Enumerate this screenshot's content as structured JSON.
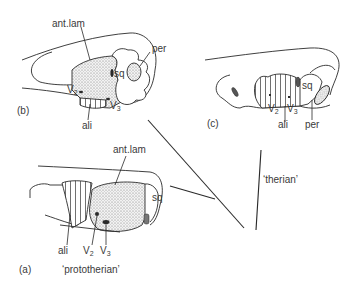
{
  "panels": {
    "b": {
      "panel_label": "(b)",
      "labels": {
        "ant_lam": "ant.lam",
        "per": "per",
        "sq": "sq",
        "v2": "V",
        "v2_sub": "2",
        "v3": "V",
        "v3_sub": "3",
        "ali": "ali"
      }
    },
    "c": {
      "panel_label": "(c)",
      "labels": {
        "sq": "sq",
        "v2": "V",
        "v2_sub": "2",
        "v3": "V",
        "v3_sub": "3",
        "ali": "ali",
        "per": "per"
      }
    },
    "a": {
      "panel_label": "(a)",
      "caption": "‘prototherian’",
      "labels": {
        "ant_lam": "ant.lam",
        "sq": "sq",
        "ali": "ali",
        "v2": "V",
        "v2_sub": "2",
        "v3": "V",
        "v3_sub": "3"
      }
    }
  },
  "tree": {
    "therian_label": "‘therian’"
  },
  "colors": {
    "line": "#2a2a2a",
    "stipple": "#dcdcdc",
    "dark": "#555555"
  }
}
